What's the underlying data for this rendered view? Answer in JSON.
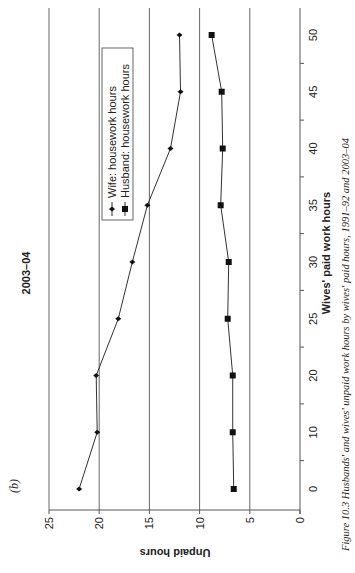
{
  "panel_label": "(b)",
  "caption": "Figure 10.3   Husbands' and wives' unpaid work hours by wives' paid hours, 1991–92 and 2003–04",
  "chart_data": {
    "type": "line",
    "title": "2003–04",
    "xlabel": "Wives' paid work hours",
    "ylabel": "Unpaid hours",
    "categories": [
      "0",
      "10",
      "20",
      "25",
      "30",
      "35",
      "40",
      "45",
      "50"
    ],
    "series": [
      {
        "name": "Wife: housework hours",
        "marker": "diamond",
        "values": [
          22.0,
          20.2,
          20.3,
          18.1,
          16.7,
          15.2,
          12.9,
          11.9,
          12.0
        ]
      },
      {
        "name": "Husband: housework hours",
        "marker": "square",
        "values": [
          6.6,
          6.7,
          6.7,
          7.2,
          7.1,
          7.9,
          7.7,
          7.8,
          8.8
        ]
      }
    ],
    "ylim": [
      0,
      25
    ],
    "yticks": [
      "0",
      "5",
      "10",
      "15",
      "20",
      "25"
    ],
    "grid": true,
    "legend_position": "upper right (inside plot)",
    "orientation": "rotated 90° counter-clockwise on page"
  }
}
